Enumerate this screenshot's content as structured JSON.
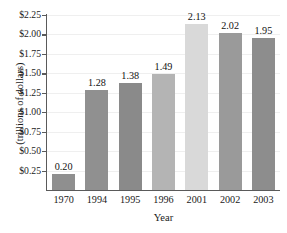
{
  "chart_data": {
    "type": "bar",
    "title": "",
    "xlabel": "Year",
    "ylabel": "(trillions of dollars)",
    "categories": [
      "1970",
      "1994",
      "1995",
      "1996",
      "2001",
      "2002",
      "2003"
    ],
    "values": [
      0.2,
      1.28,
      1.38,
      1.49,
      2.13,
      2.02,
      1.95
    ],
    "value_labels": [
      "0.20",
      "1.28",
      "1.38",
      "1.49",
      "2.13",
      "2.02",
      "1.95"
    ],
    "bar_colors": [
      "#8f8f8f",
      "#909090",
      "#8a8a8a",
      "#b4b4b4",
      "#d9d9d9",
      "#9a9a9a",
      "#8d8d8d"
    ],
    "ylim": [
      0,
      2.25
    ],
    "ytick_values": [
      0.25,
      0.5,
      0.75,
      1.0,
      1.25,
      1.5,
      1.75,
      2.0,
      2.25
    ],
    "ytick_labels": [
      "$0.25",
      "$0.50",
      "$0.75",
      "$1.00",
      "$1.25",
      "$1.50",
      "$1.75",
      "$2.00",
      "$2.25"
    ],
    "grid": true,
    "grid_color": "#efefef",
    "axis_color": "#5a5a5a",
    "legend": null,
    "legend_position": "none"
  }
}
